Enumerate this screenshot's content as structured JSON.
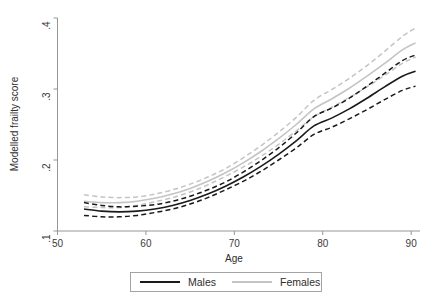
{
  "chart_data": {
    "type": "line",
    "title": "",
    "subtitle": "",
    "xlabel": "Age",
    "ylabel": "Modelled frailty score",
    "xlim": [
      50,
      91
    ],
    "ylim": [
      0.1,
      0.4
    ],
    "xticks": [
      50,
      60,
      70,
      80,
      90
    ],
    "xtick_labels": [
      "50",
      "60",
      "70",
      "80",
      "90"
    ],
    "yticks": [
      0.1,
      0.2,
      0.3,
      0.4
    ],
    "ytick_labels": [
      ".1",
      ".2",
      ".3",
      ".4"
    ],
    "grid": false,
    "legend_position": "bottom-center",
    "x": [
      53,
      55,
      57,
      59,
      61,
      63,
      65,
      67,
      69,
      71,
      73,
      75,
      77,
      79,
      81,
      83,
      85,
      87,
      89,
      90.5
    ],
    "series": [
      {
        "name": "Males",
        "style": "solid-with-dashed-ci",
        "color": "#1a1a1a",
        "values": [
          0.131,
          0.128,
          0.127,
          0.128,
          0.131,
          0.136,
          0.143,
          0.152,
          0.163,
          0.176,
          0.191,
          0.208,
          0.227,
          0.248,
          0.259,
          0.272,
          0.287,
          0.303,
          0.318,
          0.325
        ],
        "ci_lower": [
          0.122,
          0.12,
          0.12,
          0.122,
          0.126,
          0.131,
          0.138,
          0.147,
          0.158,
          0.17,
          0.184,
          0.2,
          0.217,
          0.236,
          0.246,
          0.258,
          0.271,
          0.285,
          0.298,
          0.304
        ],
        "ci_upper": [
          0.14,
          0.136,
          0.134,
          0.135,
          0.137,
          0.142,
          0.149,
          0.158,
          0.169,
          0.183,
          0.199,
          0.217,
          0.238,
          0.261,
          0.273,
          0.287,
          0.304,
          0.322,
          0.34,
          0.348
        ]
      },
      {
        "name": "Females",
        "style": "solid-with-dashed-ci",
        "color": "#c4c4c4",
        "values": [
          0.142,
          0.14,
          0.14,
          0.142,
          0.146,
          0.152,
          0.16,
          0.17,
          0.182,
          0.196,
          0.212,
          0.23,
          0.25,
          0.272,
          0.286,
          0.301,
          0.318,
          0.336,
          0.355,
          0.365
        ],
        "ci_lower": [
          0.134,
          0.133,
          0.133,
          0.136,
          0.141,
          0.147,
          0.155,
          0.165,
          0.177,
          0.19,
          0.205,
          0.222,
          0.241,
          0.261,
          0.274,
          0.288,
          0.303,
          0.319,
          0.336,
          0.345
        ],
        "ci_upper": [
          0.151,
          0.148,
          0.147,
          0.148,
          0.152,
          0.158,
          0.166,
          0.176,
          0.188,
          0.203,
          0.22,
          0.239,
          0.26,
          0.284,
          0.299,
          0.315,
          0.333,
          0.353,
          0.374,
          0.386
        ]
      }
    ],
    "legend": [
      {
        "label": "Males",
        "color": "#1a1a1a"
      },
      {
        "label": "Females",
        "color": "#c4c4c4"
      }
    ]
  }
}
